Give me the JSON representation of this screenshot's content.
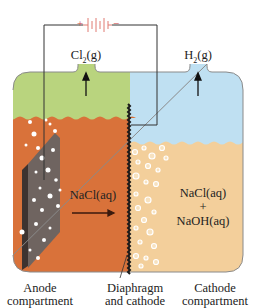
{
  "diagram": {
    "battery": {
      "positive_symbol": "+",
      "negative_symbol": "−",
      "color": "#e07a72"
    },
    "gases": {
      "left": {
        "formula_main": "Cl",
        "formula_sub": "2",
        "formula_state": "(g)"
      },
      "right": {
        "formula_main": "H",
        "formula_sub": "2",
        "formula_state": "(g)"
      }
    },
    "solutions": {
      "left": "NaCl(aq)",
      "right_line1": "NaCl(aq)",
      "right_line2": "+",
      "right_line3": "NaOH(aq)"
    },
    "labels": {
      "anode_line1": "Anode",
      "anode_line2": "compartment",
      "diaphragm_line1": "Diaphragm",
      "diaphragm_line2": "and cathode",
      "cathode_line1": "Cathode",
      "cathode_line2": "compartment"
    },
    "colors": {
      "anode_gas": "#b9d47e",
      "cathode_gas": "#bfe0f2",
      "anode_liquid": "#d9723a",
      "cathode_liquid": "#f3cf9b",
      "electrode": "#6f6460",
      "wire": "#333333"
    }
  }
}
